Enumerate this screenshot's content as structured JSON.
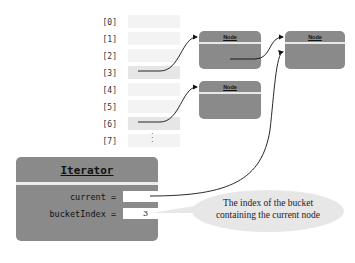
{
  "buckets": [
    {
      "index": "[0]",
      "has_node": false
    },
    {
      "index": "[1]",
      "has_node": false
    },
    {
      "index": "[2]",
      "has_node": false
    },
    {
      "index": "[3]",
      "has_node": true
    },
    {
      "index": "[4]",
      "has_node": false
    },
    {
      "index": "[5]",
      "has_node": false
    },
    {
      "index": "[6]",
      "has_node": true
    },
    {
      "index": "[7]",
      "has_node": false
    }
  ],
  "continuation": "⋮",
  "nodes": [
    {
      "label": "Node"
    },
    {
      "label": "Node"
    },
    {
      "label": "Node"
    }
  ],
  "iterator": {
    "title": "Iterator",
    "fields": [
      {
        "label": "current =",
        "value": ""
      },
      {
        "label": "bucketIndex =",
        "value": "3"
      }
    ]
  },
  "callout": {
    "text_line1": "The index of the bucket",
    "text_line2": "containing the current node"
  },
  "colors": {
    "box_fill": "#8a8a8a",
    "bucket_fill": "#f3f3f3",
    "bucket_highlight": "#e6e6e6",
    "callout_fill": "#e7e7e7"
  }
}
